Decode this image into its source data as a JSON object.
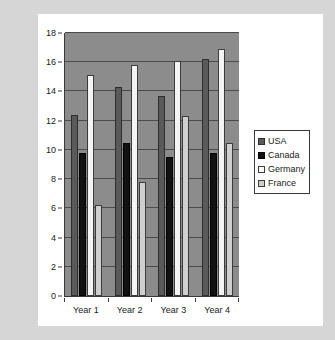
{
  "chart_data": {
    "type": "bar",
    "title": "",
    "xlabel": "",
    "ylabel": "",
    "categories": [
      "Year 1",
      "Year 2",
      "Year 3",
      "Year 4"
    ],
    "series": [
      {
        "name": "USA",
        "color": "#5a5a5a",
        "values": [
          12.4,
          14.3,
          13.7,
          16.2
        ]
      },
      {
        "name": "Canada",
        "color": "#111111",
        "values": [
          9.8,
          10.5,
          9.5,
          9.8
        ]
      },
      {
        "name": "Germany",
        "color": "#f4f4f4",
        "values": [
          15.1,
          15.8,
          16.1,
          16.9
        ]
      },
      {
        "name": "France",
        "color": "#cfcfcf",
        "values": [
          6.2,
          7.8,
          12.3,
          10.5
        ]
      }
    ],
    "ylim": [
      0,
      18
    ],
    "yticks": [
      0,
      2,
      4,
      6,
      8,
      10,
      12,
      14,
      16,
      18
    ],
    "ytick_labels": [
      "0",
      "2",
      "4",
      "6",
      "8",
      "10",
      "12",
      "14",
      "16",
      "18"
    ],
    "grid": true,
    "grid_axis": "y",
    "legend": {
      "position": "right",
      "entries": [
        "USA",
        "Canada",
        "Germany",
        "France"
      ]
    },
    "plot_background": "#8c8c8c",
    "card_background": "#ffffff",
    "page_background": "#d6d6d6"
  }
}
